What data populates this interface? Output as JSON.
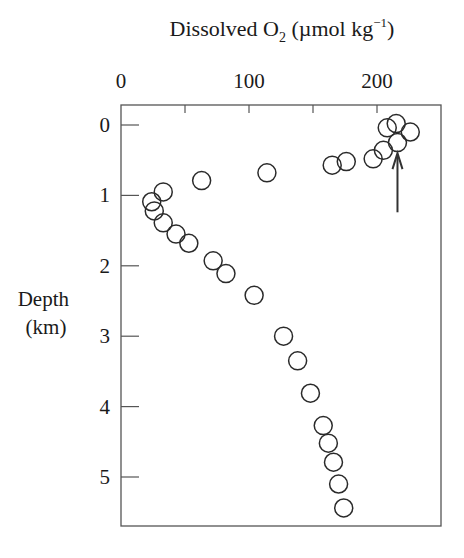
{
  "chart_data": {
    "type": "scatter",
    "title": "",
    "xlabel": "Dissolved O2 (µmol kg−1)",
    "xlabel_parts": {
      "main": "Dissolved O",
      "sub": "2",
      "unit": " (µmol kg",
      "sup": "−1",
      "close": ")"
    },
    "ylabel": "Depth (km)",
    "ylabel_lines": [
      "Depth",
      "(km)"
    ],
    "x_axis_position": "top",
    "y_inverted": true,
    "xlim": [
      0,
      250
    ],
    "ylim": [
      5.7,
      -0.3
    ],
    "x_ticks": [
      0,
      50,
      100,
      150,
      200,
      250
    ],
    "x_tick_labels": [
      {
        "value": 0,
        "label": "0"
      },
      {
        "value": 100,
        "label": "100"
      },
      {
        "value": 200,
        "label": "200"
      }
    ],
    "y_ticks": [
      0,
      1,
      2,
      3,
      4,
      5
    ],
    "y_tick_labels": [
      "0",
      "1",
      "2",
      "3",
      "4",
      "5"
    ],
    "grid": false,
    "legend": null,
    "marker": "open-circle",
    "series": [
      {
        "name": "Dissolved O2 profile",
        "points": [
          {
            "o2": 215,
            "depth": -0.02
          },
          {
            "o2": 208,
            "depth": 0.04
          },
          {
            "o2": 226,
            "depth": 0.1
          },
          {
            "o2": 216,
            "depth": 0.25
          },
          {
            "o2": 205,
            "depth": 0.36
          },
          {
            "o2": 197,
            "depth": 0.48
          },
          {
            "o2": 176,
            "depth": 0.52
          },
          {
            "o2": 165,
            "depth": 0.57
          },
          {
            "o2": 114,
            "depth": 0.68
          },
          {
            "o2": 63,
            "depth": 0.79
          },
          {
            "o2": 33,
            "depth": 0.95
          },
          {
            "o2": 24,
            "depth": 1.09
          },
          {
            "o2": 26,
            "depth": 1.22
          },
          {
            "o2": 33,
            "depth": 1.39
          },
          {
            "o2": 43,
            "depth": 1.55
          },
          {
            "o2": 53,
            "depth": 1.68
          },
          {
            "o2": 72,
            "depth": 1.93
          },
          {
            "o2": 82,
            "depth": 2.11
          },
          {
            "o2": 104,
            "depth": 2.42
          },
          {
            "o2": 127,
            "depth": 3.0
          },
          {
            "o2": 138,
            "depth": 3.35
          },
          {
            "o2": 148,
            "depth": 3.81
          },
          {
            "o2": 158,
            "depth": 4.27
          },
          {
            "o2": 162,
            "depth": 4.52
          },
          {
            "o2": 166,
            "depth": 4.79
          },
          {
            "o2": 170,
            "depth": 5.1
          },
          {
            "o2": 174,
            "depth": 5.44
          }
        ]
      }
    ],
    "annotations": [
      {
        "type": "arrow",
        "o2": 216,
        "depth_tip": 0.4,
        "depth_tail": 1.24,
        "direction": "up"
      }
    ]
  },
  "layout": {
    "plot_left": 121,
    "plot_right": 441,
    "plot_top": 105,
    "plot_bottom": 526,
    "depth0_y": 125,
    "px_per_km": 70.4,
    "px_per_unit": 1.28,
    "marker_radius": 9,
    "ink_color": "#2a2a2a"
  }
}
